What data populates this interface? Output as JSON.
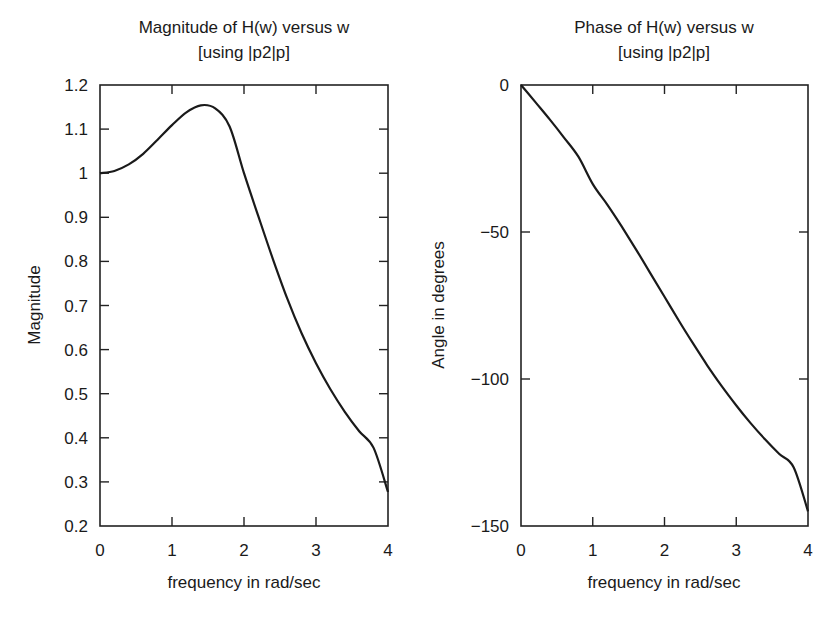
{
  "chart_data": [
    {
      "type": "line",
      "title": "Magnitude of H(w) versus w",
      "subtitle": "[using |p2|p]",
      "xlabel": "frequency in rad/sec",
      "ylabel": "Magnitude",
      "xlim": [
        0,
        4
      ],
      "ylim": [
        0.2,
        1.2
      ],
      "xticks": [
        0,
        1,
        2,
        3,
        4
      ],
      "xtick_labels": [
        "0",
        "1",
        "2",
        "3",
        "4"
      ],
      "yticks": [
        0.2,
        0.3,
        0.4,
        0.5,
        0.6,
        0.7,
        0.8,
        0.9,
        1.0,
        1.1,
        1.2
      ],
      "ytick_labels": [
        "0.2",
        "0.3",
        "0.4",
        "0.5",
        "0.6",
        "0.7",
        "0.8",
        "0.9",
        "1",
        "1.1",
        "1.2"
      ],
      "grid": false,
      "legend": null,
      "series": [
        {
          "name": "|H(w)|",
          "x": [
            0,
            0.2,
            0.4,
            0.6,
            0.8,
            1.0,
            1.2,
            1.4,
            1.6,
            1.8,
            2.0,
            2.2,
            2.4,
            2.6,
            2.8,
            3.0,
            3.2,
            3.4,
            3.6,
            3.8,
            4.0
          ],
          "y": [
            1.0,
            1.005,
            1.02,
            1.044,
            1.076,
            1.109,
            1.138,
            1.154,
            1.147,
            1.106,
            1.0,
            0.902,
            0.806,
            0.716,
            0.637,
            0.569,
            0.51,
            0.459,
            0.415,
            0.377,
            0.277
          ]
        }
      ]
    },
    {
      "type": "line",
      "title": "Phase of H(w) versus w",
      "subtitle": "[using |p2|p]",
      "xlabel": "frequency in rad/sec",
      "ylabel": "Angle in degrees",
      "xlim": [
        0,
        4
      ],
      "ylim": [
        -150,
        0
      ],
      "xticks": [
        0,
        1,
        2,
        3,
        4
      ],
      "xtick_labels": [
        "0",
        "1",
        "2",
        "3",
        "4"
      ],
      "yticks": [
        -150,
        -100,
        -50,
        0
      ],
      "ytick_labels": [
        "−150",
        "−100",
        "−50",
        "0"
      ],
      "grid": false,
      "legend": null,
      "series": [
        {
          "name": "angle H(w)",
          "x": [
            0,
            0.2,
            0.4,
            0.6,
            0.8,
            1.0,
            1.2,
            1.4,
            1.6,
            1.8,
            2.0,
            2.2,
            2.4,
            2.6,
            2.8,
            3.0,
            3.2,
            3.4,
            3.6,
            3.8,
            4.0
          ],
          "y": [
            0,
            -5.8,
            -11.7,
            -17.9,
            -24.4,
            -33.7,
            -40.6,
            -48.0,
            -55.8,
            -63.9,
            -72.0,
            -80.2,
            -88.0,
            -95.5,
            -102.5,
            -109.0,
            -115.0,
            -120.5,
            -125.5,
            -130.0,
            -145.0
          ]
        }
      ]
    }
  ]
}
